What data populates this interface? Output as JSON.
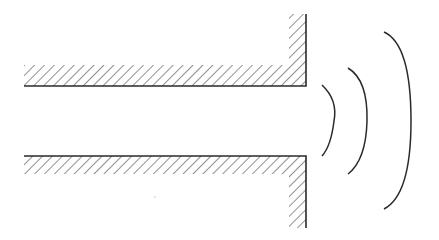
{
  "diagram": {
    "canvas": {
      "width": 439,
      "height": 240,
      "background": "#ffffff"
    },
    "colors": {
      "stroke": "#2a2a2a",
      "hatch": "#555555"
    },
    "tube": {
      "upper_wall": {
        "inner_edge_y": 86,
        "hatch_top_y": 65,
        "start_x": 24,
        "flange_x": 306,
        "flange_inner_x": 289,
        "flange_top_y": 14
      },
      "lower_wall": {
        "inner_edge_y": 156,
        "hatch_bottom_y": 174,
        "start_x": 24,
        "flange_x": 306,
        "flange_inner_x": 289,
        "flange_bottom_y": 228
      }
    },
    "wavefronts": [
      {
        "label": "wave-1",
        "top": [
          322,
          85
        ],
        "apex": [
          333,
          120
        ],
        "bottom": [
          322,
          156
        ]
      },
      {
        "label": "wave-2",
        "top": [
          348,
          68
        ],
        "apex": [
          366,
          120
        ],
        "bottom": [
          348,
          174
        ]
      },
      {
        "label": "wave-3",
        "top": [
          384,
          32
        ],
        "apex": [
          410,
          120
        ],
        "bottom": [
          384,
          209
        ]
      }
    ]
  }
}
